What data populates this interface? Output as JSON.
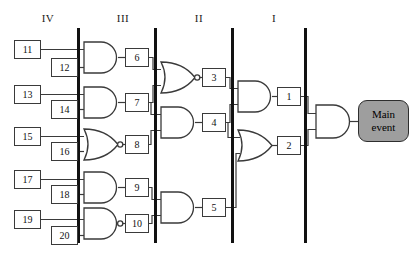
{
  "diagram": {
    "type": "fault-tree",
    "colors": {
      "line": "#3a3a3a",
      "bar": "#111111",
      "main_event_fill": "#9e9e9e",
      "box_fill": "#ffffff",
      "text": "#111111"
    },
    "level_labels": [
      {
        "name": "level-iv",
        "text": "IV",
        "x": 33,
        "y": 12
      },
      {
        "name": "level-iii",
        "text": "III",
        "x": 108,
        "y": 12
      },
      {
        "name": "level-ii",
        "text": "II",
        "x": 184,
        "y": 12
      },
      {
        "name": "level-i",
        "text": "I",
        "x": 259,
        "y": 12
      }
    ],
    "separator_bars": [
      {
        "name": "bar-iv-iii",
        "x": 78,
        "y1": 28,
        "y2": 243
      },
      {
        "name": "bar-iii-ii",
        "x": 155,
        "y1": 28,
        "y2": 243
      },
      {
        "name": "bar-ii-i",
        "x": 232,
        "y1": 28,
        "y2": 243
      },
      {
        "name": "bar-i-top",
        "x": 305,
        "y1": 28,
        "y2": 243
      }
    ],
    "basic_events": [
      {
        "name": "event-11",
        "label": "11",
        "x": 14,
        "y": 40,
        "w": 27,
        "h": 19
      },
      {
        "name": "event-12",
        "label": "12",
        "x": 51,
        "y": 58,
        "w": 27,
        "h": 19
      },
      {
        "name": "event-13",
        "label": "13",
        "x": 14,
        "y": 85,
        "w": 27,
        "h": 19
      },
      {
        "name": "event-14",
        "label": "14",
        "x": 51,
        "y": 100,
        "w": 27,
        "h": 19
      },
      {
        "name": "event-15",
        "label": "15",
        "x": 14,
        "y": 127,
        "w": 27,
        "h": 19
      },
      {
        "name": "event-16",
        "label": "16",
        "x": 51,
        "y": 142,
        "w": 27,
        "h": 19
      },
      {
        "name": "event-17",
        "label": "17",
        "x": 14,
        "y": 170,
        "w": 27,
        "h": 19
      },
      {
        "name": "event-18",
        "label": "18",
        "x": 51,
        "y": 185,
        "w": 27,
        "h": 19
      },
      {
        "name": "event-19",
        "label": "19",
        "x": 14,
        "y": 210,
        "w": 27,
        "h": 19
      },
      {
        "name": "event-20",
        "label": "20",
        "x": 51,
        "y": 226,
        "w": 27,
        "h": 19
      }
    ],
    "intermediate_events": [
      {
        "name": "event-6",
        "label": "6",
        "x": 125,
        "y": 48,
        "w": 24,
        "h": 19
      },
      {
        "name": "event-7",
        "label": "7",
        "x": 125,
        "y": 93,
        "w": 24,
        "h": 19
      },
      {
        "name": "event-8",
        "label": "8",
        "x": 125,
        "y": 135,
        "w": 24,
        "h": 19
      },
      {
        "name": "event-9",
        "label": "9",
        "x": 125,
        "y": 178,
        "w": 24,
        "h": 19
      },
      {
        "name": "event-10",
        "label": "10",
        "x": 125,
        "y": 214,
        "w": 24,
        "h": 19
      },
      {
        "name": "event-3",
        "label": "3",
        "x": 202,
        "y": 68,
        "w": 24,
        "h": 19
      },
      {
        "name": "event-4",
        "label": "4",
        "x": 202,
        "y": 113,
        "w": 24,
        "h": 19
      },
      {
        "name": "event-5",
        "label": "5",
        "x": 202,
        "y": 198,
        "w": 24,
        "h": 19
      },
      {
        "name": "event-1",
        "label": "1",
        "x": 277,
        "y": 87,
        "w": 24,
        "h": 19
      },
      {
        "name": "event-2",
        "label": "2",
        "x": 277,
        "y": 136,
        "w": 24,
        "h": 19
      }
    ],
    "main_event": {
      "name": "main-event-box",
      "line1": "Main",
      "line2": "event",
      "x": 358,
      "y": 100,
      "w": 51,
      "h": 42
    },
    "gates": [
      {
        "name": "gate-and-6",
        "kind": "and",
        "x": 84,
        "y": 42,
        "w": 34,
        "h": 31,
        "inputs": [
          "event-11",
          "event-12"
        ],
        "output": "event-6"
      },
      {
        "name": "gate-and-7",
        "kind": "and",
        "x": 84,
        "y": 87,
        "w": 34,
        "h": 31,
        "inputs": [
          "event-13",
          "event-14"
        ],
        "output": "event-7"
      },
      {
        "name": "gate-nor-8",
        "kind": "nor",
        "x": 84,
        "y": 129,
        "w": 34,
        "h": 31,
        "inputs": [
          "event-15",
          "event-16"
        ],
        "output": "event-8"
      },
      {
        "name": "gate-and-9",
        "kind": "and",
        "x": 84,
        "y": 172,
        "w": 34,
        "h": 31,
        "inputs": [
          "event-17",
          "event-18"
        ],
        "output": "event-9"
      },
      {
        "name": "gate-nand-10",
        "kind": "nand",
        "x": 84,
        "y": 208,
        "w": 34,
        "h": 31,
        "inputs": [
          "event-19",
          "event-20"
        ],
        "output": "event-10"
      },
      {
        "name": "gate-nor-3",
        "kind": "nor",
        "x": 161,
        "y": 62,
        "w": 34,
        "h": 31,
        "inputs": [
          "event-6",
          "event-7"
        ],
        "output": "event-3"
      },
      {
        "name": "gate-and-4",
        "kind": "and",
        "x": 161,
        "y": 107,
        "w": 34,
        "h": 31,
        "inputs": [
          "event-7",
          "event-8"
        ],
        "output": "event-4"
      },
      {
        "name": "gate-and-5",
        "kind": "and",
        "x": 161,
        "y": 192,
        "w": 34,
        "h": 31,
        "inputs": [
          "event-9",
          "event-10"
        ],
        "output": "event-5"
      },
      {
        "name": "gate-and-1",
        "kind": "and",
        "x": 238,
        "y": 81,
        "w": 34,
        "h": 31,
        "inputs": [
          "event-3",
          "event-4"
        ],
        "output": "event-1"
      },
      {
        "name": "gate-or-2",
        "kind": "or",
        "x": 238,
        "y": 130,
        "w": 34,
        "h": 31,
        "inputs": [
          "event-4",
          "event-5"
        ],
        "output": "event-2"
      },
      {
        "name": "gate-and-main",
        "kind": "and",
        "x": 316,
        "y": 105,
        "w": 34,
        "h": 33,
        "inputs": [
          "event-1",
          "event-2"
        ],
        "output": "main-event-box"
      }
    ],
    "connections": [
      {
        "name": "wire-11-to-gate-and-6"
      },
      {
        "name": "wire-12-to-gate-and-6"
      },
      {
        "name": "wire-gate-and-6-to-6"
      },
      {
        "name": "wire-13-to-gate-and-7"
      },
      {
        "name": "wire-14-to-gate-and-7"
      },
      {
        "name": "wire-gate-and-7-to-7"
      },
      {
        "name": "wire-15-to-gate-nor-8"
      },
      {
        "name": "wire-16-to-gate-nor-8"
      },
      {
        "name": "wire-gate-nor-8-to-8"
      },
      {
        "name": "wire-17-to-gate-and-9"
      },
      {
        "name": "wire-18-to-gate-and-9"
      },
      {
        "name": "wire-gate-and-9-to-9"
      },
      {
        "name": "wire-19-to-gate-nand-10"
      },
      {
        "name": "wire-20-to-gate-nand-10"
      },
      {
        "name": "wire-gate-nand-10-to-10"
      },
      {
        "name": "wire-6-to-gate-nor-3"
      },
      {
        "name": "wire-7-to-gate-nor-3"
      },
      {
        "name": "wire-gate-nor-3-to-3"
      },
      {
        "name": "wire-7-to-gate-and-4"
      },
      {
        "name": "wire-8-to-gate-and-4"
      },
      {
        "name": "wire-gate-and-4-to-4"
      },
      {
        "name": "wire-9-to-gate-and-5"
      },
      {
        "name": "wire-10-to-gate-and-5"
      },
      {
        "name": "wire-gate-and-5-to-5"
      },
      {
        "name": "wire-3-to-gate-and-1"
      },
      {
        "name": "wire-4-to-gate-and-1"
      },
      {
        "name": "wire-gate-and-1-to-1"
      },
      {
        "name": "wire-4-to-gate-or-2"
      },
      {
        "name": "wire-5-to-gate-or-2"
      },
      {
        "name": "wire-gate-or-2-to-2"
      },
      {
        "name": "wire-1-to-gate-and-main"
      },
      {
        "name": "wire-2-to-gate-and-main"
      },
      {
        "name": "wire-gate-and-main-to-main-event"
      }
    ]
  }
}
